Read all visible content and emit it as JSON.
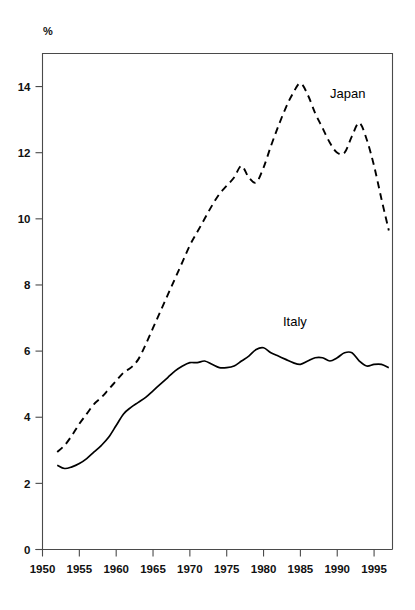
{
  "chart_data": {
    "type": "line",
    "title": "",
    "subtitle": "",
    "xlabel": "",
    "ylabel": "%",
    "unit_label": "%",
    "xlim": [
      1950,
      1997.5
    ],
    "ylim": [
      0,
      15
    ],
    "grid": false,
    "legend_position": "inline-annotations",
    "x_ticks": [
      1950,
      1955,
      1960,
      1965,
      1970,
      1975,
      1980,
      1985,
      1990,
      1995
    ],
    "x_tick_labels": [
      "1950",
      "1955",
      "1960",
      "1965",
      "1970",
      "1975",
      "1980",
      "1985",
      "1990",
      "1995"
    ],
    "y_ticks": [
      0,
      2,
      4,
      6,
      8,
      10,
      12,
      14
    ],
    "y_tick_labels": [
      "0",
      "2",
      "4",
      "6",
      "8",
      "10",
      "12",
      "14"
    ],
    "annotations": [
      {
        "text": "Japan",
        "x": 1988.5,
        "y": 13.4
      },
      {
        "text": "Italy",
        "x": 1981.5,
        "y": 6.75
      }
    ],
    "series": [
      {
        "name": "Japan",
        "style": "dashed",
        "color": "#000000",
        "x": [
          1952,
          1953,
          1954,
          1955,
          1956,
          1957,
          1958,
          1959,
          1960,
          1961,
          1962,
          1963,
          1964,
          1965,
          1966,
          1967,
          1968,
          1969,
          1970,
          1971,
          1972,
          1973,
          1974,
          1975,
          1976,
          1977,
          1978,
          1979,
          1980,
          1981,
          1982,
          1983,
          1984,
          1985,
          1986,
          1987,
          1988,
          1989,
          1990,
          1991,
          1992,
          1993,
          1994,
          1995,
          1996,
          1997
        ],
        "values": [
          2.95,
          3.15,
          3.45,
          3.8,
          4.1,
          4.4,
          4.6,
          4.85,
          5.1,
          5.35,
          5.5,
          5.75,
          6.2,
          6.7,
          7.2,
          7.7,
          8.2,
          8.7,
          9.2,
          9.6,
          10.0,
          10.4,
          10.75,
          11.0,
          11.25,
          11.6,
          11.25,
          11.1,
          11.55,
          12.2,
          12.8,
          13.35,
          13.8,
          14.1,
          13.75,
          13.2,
          12.75,
          12.3,
          12.0,
          12.0,
          12.5,
          12.9,
          12.4,
          11.6,
          10.6,
          9.65
        ]
      },
      {
        "name": "Italy",
        "style": "solid",
        "color": "#000000",
        "x": [
          1952,
          1953,
          1954,
          1955,
          1956,
          1957,
          1958,
          1959,
          1960,
          1961,
          1962,
          1963,
          1964,
          1965,
          1966,
          1967,
          1968,
          1969,
          1970,
          1971,
          1972,
          1973,
          1974,
          1975,
          1976,
          1977,
          1978,
          1979,
          1980,
          1981,
          1982,
          1983,
          1984,
          1985,
          1986,
          1987,
          1988,
          1989,
          1990,
          1991,
          1992,
          1993,
          1994,
          1995,
          1996,
          1997
        ],
        "values": [
          2.55,
          2.45,
          2.5,
          2.6,
          2.75,
          2.95,
          3.15,
          3.4,
          3.75,
          4.1,
          4.3,
          4.45,
          4.6,
          4.8,
          5.0,
          5.2,
          5.4,
          5.55,
          5.65,
          5.65,
          5.7,
          5.6,
          5.5,
          5.5,
          5.55,
          5.7,
          5.85,
          6.05,
          6.1,
          5.95,
          5.85,
          5.75,
          5.65,
          5.6,
          5.7,
          5.8,
          5.8,
          5.7,
          5.8,
          5.95,
          5.95,
          5.7,
          5.55,
          5.6,
          5.6,
          5.5
        ]
      }
    ]
  }
}
